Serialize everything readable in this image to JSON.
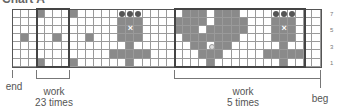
{
  "title": "Chart A",
  "grid": {
    "columns": 38,
    "rows": 7,
    "row_numbers": [
      "7",
      "5",
      "3",
      "1"
    ],
    "colors": {
      "dark": "#8a8a8a",
      "light": "#ffffff",
      "border": "#555555"
    },
    "dark_cells": {
      "7": [
        3,
        7,
        21,
        22,
        23,
        25,
        26,
        27
      ],
      "6": [
        13,
        14,
        15,
        20,
        21,
        22,
        23,
        25,
        26,
        27,
        28,
        32,
        33,
        34
      ],
      "5": [
        13,
        14,
        15,
        20,
        21,
        22,
        24,
        25,
        26,
        27,
        28,
        32,
        33,
        34
      ],
      "4": [
        1,
        5,
        9,
        13,
        14,
        15,
        21,
        22,
        23,
        24,
        25,
        26,
        27,
        32,
        33,
        34
      ],
      "3": [
        14,
        22,
        23,
        25,
        26,
        33
      ],
      "2": [
        12,
        13,
        14,
        15,
        16,
        23,
        24,
        25,
        31,
        32,
        33,
        34,
        35
      ],
      "1": [
        3,
        7,
        14,
        24,
        33
      ]
    },
    "bobble_cells": {
      "7": [
        13,
        14,
        15,
        32,
        33,
        34
      ]
    },
    "cross_cells": {
      "5": [
        14,
        33
      ]
    },
    "dot_cells": {
      "3": [
        24
      ]
    }
  },
  "repeats": [
    {
      "label_line1": "work",
      "label_line2": "23 times",
      "start_col": 3,
      "end_col": 6
    },
    {
      "label_line1": "work",
      "label_line2": "5 times",
      "start_col": 20,
      "end_col": 35
    }
  ],
  "edges": {
    "left": "end",
    "right": "beg"
  }
}
